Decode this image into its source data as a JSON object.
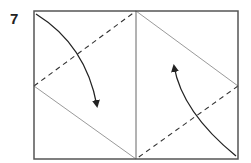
{
  "step": {
    "number": "7"
  },
  "diagram": {
    "colors": {
      "border": "#555555",
      "crease": "#9a9a9a",
      "fold_line": "#333333",
      "arrow": "#222222"
    },
    "rect": {
      "x1": 34,
      "y1": 11,
      "x2": 238,
      "y2": 159
    },
    "center_x": 136,
    "mid_y": 86,
    "arrows": [
      {
        "name": "left-fold-arrow",
        "direction": "down"
      },
      {
        "name": "right-fold-arrow",
        "direction": "up"
      }
    ]
  }
}
